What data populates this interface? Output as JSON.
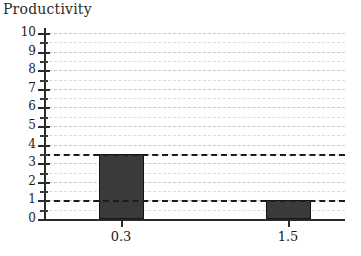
{
  "chart_data": {
    "type": "bar",
    "title": "Productivity",
    "xlabel": "",
    "ylabel": "",
    "categories": [
      "0.3",
      "1.5"
    ],
    "values": [
      3.5,
      1.0
    ],
    "ylim": [
      0,
      10
    ],
    "y_major_ticks": [
      0,
      1,
      2,
      3,
      4,
      5,
      6,
      7,
      8,
      9,
      10
    ],
    "y_minor_ticks": [
      0.5,
      1.5,
      2.5,
      3.5,
      4.5,
      5.5,
      6.5,
      7.5,
      8.5,
      9.5
    ],
    "y_tick_labels": [
      "0",
      "1",
      "2",
      "3",
      "4",
      "5",
      "6",
      "7",
      "8",
      "9",
      "10"
    ],
    "grid": true,
    "grid_style": "dashed",
    "legend": "none",
    "reference_lines": [
      3.5,
      1.0
    ],
    "bar_color": "#3a3a3a",
    "grid_color": "#c9c9c9",
    "axis_color": "#2b2b2b"
  }
}
